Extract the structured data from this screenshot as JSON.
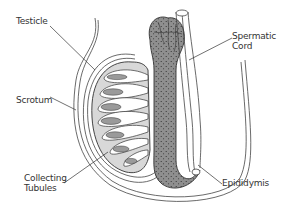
{
  "diagram": {
    "labels": {
      "testicle": "Testicle",
      "scrotum": "Scrotum",
      "collecting_tubules_line1": "Collecting",
      "collecting_tubules_line2": "Tubules",
      "spermatic_cord_line1": "Spermatic",
      "spermatic_cord_line2": "Cord",
      "epididymis": "Epididymis"
    },
    "colors": {
      "line": "#333333",
      "testis_fill": "#d8d8d8",
      "epididymis_fill": "#8c8c8c",
      "background": "#ffffff"
    }
  }
}
